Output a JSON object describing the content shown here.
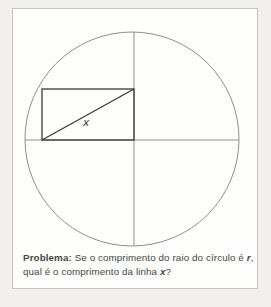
{
  "page": {
    "background": "#f2f0ec",
    "card": {
      "background": "#fdfdfc",
      "border_color": "#c6c4c0"
    }
  },
  "diagram": {
    "colors": {
      "thin_line": "#8f8f8f",
      "thick_line": "#3a3a3a",
      "label": "#3a3a3a"
    },
    "circle": {
      "cx": 119,
      "cy": 130,
      "r": 107
    },
    "vertical_diameter": {
      "x1": 121,
      "y1": 23,
      "x2": 121,
      "y2": 236
    },
    "horizontal_diameter": {
      "x1": 12,
      "y1": 131,
      "x2": 226,
      "y2": 131
    },
    "rectangle": {
      "x": 29,
      "y": 80,
      "width": 92,
      "height": 51
    },
    "diagonal": {
      "x1": 29,
      "y1": 131,
      "x2": 121,
      "y2": 80
    },
    "x_label": {
      "text": "x",
      "x": 70,
      "y": 117
    }
  },
  "caption": {
    "line1": {
      "bold": "Problema:",
      "normal": " Se o comprimento do raio do círculo é ",
      "var": "r",
      "after": ","
    },
    "line2": {
      "normal": "qual é o comprimento da linha ",
      "var": "x",
      "after": "?"
    },
    "text_color": "#474747"
  }
}
